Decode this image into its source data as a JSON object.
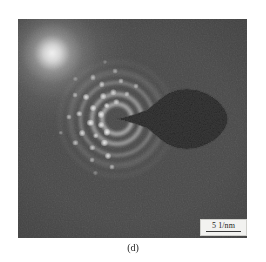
{
  "figure": {
    "caption": "(d)",
    "panel_label": "electron-diffraction-pattern",
    "background_color": "#ffffff",
    "panel_color": "#4a4a4a"
  },
  "scalebar": {
    "label": "5 1/nm",
    "value": 5,
    "unit": "1/nm",
    "box_color": "#f2f2f0",
    "rule_color": "#3a3a3a"
  },
  "beamstop": {
    "name": "beam-stopper",
    "color": "#3a3a3a"
  },
  "chart_data": {
    "type": "scatter",
    "title": "(d)",
    "subtitle": "Selected area electron diffraction (SAED) pattern",
    "xlabel": "",
    "ylabel": "",
    "scale_label": "5 1/nm",
    "center": {
      "x": 117,
      "y": 119
    },
    "grid": false,
    "legend": null,
    "rings": [
      {
        "index": 1,
        "radius_px": 17,
        "intensity": 0.95,
        "width_px": 4,
        "note": "innermost bright halo ring"
      },
      {
        "index": 2,
        "radius_px": 27,
        "intensity": 0.8,
        "width_px": 4,
        "note": "second diffraction ring"
      },
      {
        "index": 3,
        "radius_px": 38,
        "intensity": 0.55,
        "width_px": 3,
        "note": "third diffraction ring"
      },
      {
        "index": 4,
        "radius_px": 48,
        "intensity": 0.38,
        "width_px": 3,
        "note": "fourth diffraction ring"
      },
      {
        "index": 5,
        "radius_px": 58,
        "intensity": 0.2,
        "width_px": 2,
        "note": "faint outer ring"
      }
    ],
    "spots": [
      {
        "ring": 1,
        "angle_deg": 128,
        "brightness": 0.95
      },
      {
        "ring": 1,
        "angle_deg": 160,
        "brightness": 0.85
      },
      {
        "ring": 1,
        "angle_deg": 196,
        "brightness": 0.9
      },
      {
        "ring": 1,
        "angle_deg": 232,
        "brightness": 0.8
      },
      {
        "ring": 1,
        "angle_deg": 268,
        "brightness": 0.7
      },
      {
        "ring": 2,
        "angle_deg": 118,
        "brightness": 0.9
      },
      {
        "ring": 2,
        "angle_deg": 142,
        "brightness": 0.75
      },
      {
        "ring": 2,
        "angle_deg": 172,
        "brightness": 0.95
      },
      {
        "ring": 2,
        "angle_deg": 205,
        "brightness": 0.85
      },
      {
        "ring": 2,
        "angle_deg": 238,
        "brightness": 0.8
      },
      {
        "ring": 2,
        "angle_deg": 262,
        "brightness": 0.7
      },
      {
        "ring": 2,
        "angle_deg": 292,
        "brightness": 0.6
      },
      {
        "ring": 3,
        "angle_deg": 104,
        "brightness": 0.85
      },
      {
        "ring": 3,
        "angle_deg": 131,
        "brightness": 0.7
      },
      {
        "ring": 3,
        "angle_deg": 158,
        "brightness": 0.8
      },
      {
        "ring": 3,
        "angle_deg": 188,
        "brightness": 0.75
      },
      {
        "ring": 3,
        "angle_deg": 216,
        "brightness": 0.85
      },
      {
        "ring": 3,
        "angle_deg": 246,
        "brightness": 0.7
      },
      {
        "ring": 3,
        "angle_deg": 276,
        "brightness": 0.6
      },
      {
        "ring": 3,
        "angle_deg": 300,
        "brightness": 0.55
      },
      {
        "ring": 4,
        "angle_deg": 96,
        "brightness": 0.6
      },
      {
        "ring": 4,
        "angle_deg": 122,
        "brightness": 0.55
      },
      {
        "ring": 4,
        "angle_deg": 150,
        "brightness": 0.65
      },
      {
        "ring": 4,
        "angle_deg": 182,
        "brightness": 0.6
      },
      {
        "ring": 4,
        "angle_deg": 210,
        "brightness": 0.55
      },
      {
        "ring": 4,
        "angle_deg": 240,
        "brightness": 0.6
      },
      {
        "ring": 4,
        "angle_deg": 268,
        "brightness": 0.5
      },
      {
        "ring": 5,
        "angle_deg": 112,
        "brightness": 0.35
      },
      {
        "ring": 5,
        "angle_deg": 166,
        "brightness": 0.4
      },
      {
        "ring": 5,
        "angle_deg": 224,
        "brightness": 0.35
      },
      {
        "ring": 5,
        "angle_deg": 258,
        "brightness": 0.3
      }
    ]
  }
}
